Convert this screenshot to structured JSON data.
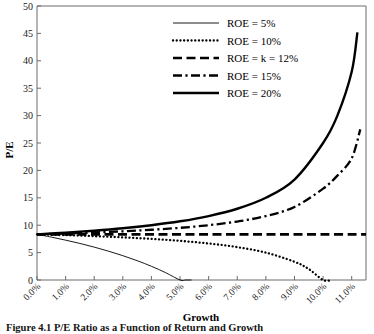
{
  "figure": {
    "caption": "Figure 4.1  P/E Ratio as a Function of Return and Growth"
  },
  "chart_data": {
    "type": "line",
    "title": "",
    "xlabel": "Growth",
    "ylabel": "P/E",
    "xlim": [
      0.0,
      11.5
    ],
    "ylim": [
      0,
      50
    ],
    "grid": false,
    "legend_position": "top-right",
    "xtick_labels": [
      "0.0%",
      "1.0%",
      "2.0%",
      "3.0%",
      "4.0%",
      "5.0%",
      "6.0%",
      "7.0%",
      "8.0%",
      "9.0%",
      "10.0%",
      "11.0%"
    ],
    "xticks": [
      0,
      1,
      2,
      3,
      4,
      5,
      6,
      7,
      8,
      9,
      10,
      11
    ],
    "ytick_labels": [
      "0",
      "5",
      "10",
      "15",
      "20",
      "25",
      "30",
      "35",
      "40",
      "45",
      "50"
    ],
    "yticks": [
      0,
      5,
      10,
      15,
      20,
      25,
      30,
      35,
      40,
      45,
      50
    ],
    "cost_of_capital_k_percent": 12,
    "converge_pe_at_zero_growth": 8.33,
    "series": [
      {
        "name": "ROE = 5%",
        "roe_percent": 5,
        "style": "solid-thin",
        "x": [
          0.0,
          0.5,
          1.0,
          1.5,
          2.0,
          2.5,
          3.0,
          3.5,
          4.0,
          4.5,
          5.0,
          5.2,
          5.4
        ],
        "values": [
          8.33,
          7.83,
          7.27,
          6.67,
          6.0,
          5.26,
          4.44,
          3.53,
          2.5,
          1.33,
          0.0,
          0.0,
          0.0
        ]
      },
      {
        "name": "ROE = 10%",
        "roe_percent": 10,
        "style": "dotted",
        "x": [
          0.0,
          1.0,
          2.0,
          3.0,
          4.0,
          5.0,
          6.0,
          7.0,
          8.0,
          9.0,
          9.5,
          10.0,
          10.3
        ],
        "values": [
          8.33,
          8.18,
          8.0,
          7.78,
          7.5,
          7.14,
          6.67,
          6.0,
          5.0,
          3.33,
          2.0,
          0.0,
          0.0
        ]
      },
      {
        "name": "ROE = k = 12%",
        "roe_percent": 12,
        "style": "dashed",
        "x": [
          0.0,
          1.0,
          2.0,
          3.0,
          4.0,
          5.0,
          6.0,
          7.0,
          8.0,
          9.0,
          10.0,
          11.0,
          11.5
        ],
        "values": [
          8.33,
          8.33,
          8.33,
          8.33,
          8.33,
          8.33,
          8.33,
          8.33,
          8.33,
          8.33,
          8.33,
          8.33,
          8.33
        ]
      },
      {
        "name": "ROE = 15%",
        "roe_percent": 15,
        "style": "dash-dot",
        "x": [
          0.0,
          1.0,
          2.0,
          3.0,
          4.0,
          5.0,
          6.0,
          7.0,
          8.0,
          9.0,
          10.0,
          10.5,
          11.0,
          11.3
        ],
        "values": [
          8.33,
          8.48,
          8.67,
          8.89,
          9.17,
          9.52,
          10.0,
          10.67,
          11.67,
          13.33,
          16.67,
          19.05,
          22.2,
          27.5
        ]
      },
      {
        "name": "ROE = 20%",
        "roe_percent": 20,
        "style": "solid-thick",
        "x": [
          0.0,
          1.0,
          2.0,
          3.0,
          4.0,
          5.0,
          6.0,
          7.0,
          8.0,
          9.0,
          10.0,
          10.5,
          11.0,
          11.2
        ],
        "values": [
          8.33,
          8.64,
          9.0,
          9.44,
          10.0,
          10.71,
          11.67,
          13.0,
          15.0,
          18.33,
          25.0,
          30.0,
          38.0,
          45.2
        ]
      }
    ]
  },
  "legend": {
    "items": [
      {
        "label": "ROE = 5%"
      },
      {
        "label": "ROE = 10%"
      },
      {
        "label": "ROE = k = 12%"
      },
      {
        "label": "ROE = 15%"
      },
      {
        "label": "ROE = 20%"
      }
    ]
  }
}
